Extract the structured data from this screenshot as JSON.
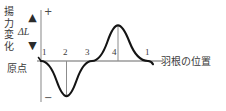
{
  "figure": {
    "y_axis_caption": "揚\n力\n変\n化",
    "y_axis_symbol": "ΔL",
    "origin_label": "原点",
    "plus_sign": "+",
    "minus_sign": "−",
    "x_axis_caption": "羽根の位置",
    "arrow_up": "▲",
    "arrow_down": "▼",
    "axis_color": "#8c8c8c",
    "curve_color": "#1a1a1a",
    "text_color": "#3a3a3a",
    "background": "#ffffff"
  },
  "chart_data": {
    "type": "line",
    "title": "",
    "subtitle": "",
    "xlabel": "羽根の位置",
    "ylabel": "揚力変化 ΔL",
    "grid": false,
    "legend": null,
    "xlim": [
      1,
      5
    ],
    "ylim": [
      -1,
      1
    ],
    "tick_labels": [
      "1",
      "2",
      "3",
      "4",
      "1"
    ],
    "tick_positions": [
      1,
      2,
      3,
      4,
      5
    ],
    "annotations": [
      {
        "text": "+",
        "where": "y-axis-top"
      },
      {
        "text": "−",
        "where": "y-axis-bottom"
      },
      {
        "text": "原点",
        "where": "origin"
      }
    ],
    "dropline_at": [
      2,
      4
    ],
    "series": [
      {
        "name": "揚力変化",
        "x": [
          1.0,
          1.1,
          1.2,
          1.3,
          1.4,
          1.5,
          1.6,
          1.7,
          1.8,
          1.9,
          2.0,
          2.1,
          2.2,
          2.3,
          2.4,
          2.5,
          2.6,
          2.7,
          2.8,
          2.9,
          3.0,
          3.1,
          3.2,
          3.3,
          3.4,
          3.5,
          3.6,
          3.7,
          3.8,
          3.9,
          4.0,
          4.1,
          4.2,
          4.3,
          4.4,
          4.5,
          4.6,
          4.7,
          4.8,
          4.9,
          5.0
        ],
        "y": [
          0.0,
          -0.309,
          -0.588,
          -0.809,
          -0.951,
          -1.0,
          -0.951,
          -0.809,
          -0.588,
          -0.309,
          -1.0,
          -0.309,
          -0.588,
          -0.809,
          -0.951,
          0.0,
          0.309,
          0.588,
          0.809,
          0.951,
          0.0,
          0.309,
          0.588,
          0.809,
          0.951,
          1.0,
          0.951,
          0.809,
          0.588,
          0.309,
          1.0,
          0.951,
          0.809,
          0.588,
          0.309,
          0.0,
          -0.309,
          -0.588,
          -0.809,
          -0.951,
          0.0
        ]
      }
    ]
  },
  "ticks": [
    {
      "label": "1",
      "x": 42,
      "y": 48
    },
    {
      "label": "2",
      "x": 63,
      "y": 48
    },
    {
      "label": "3",
      "x": 85,
      "y": 48
    },
    {
      "label": "4",
      "x": 112,
      "y": 48
    },
    {
      "label": "1",
      "x": 145,
      "y": 48
    }
  ]
}
